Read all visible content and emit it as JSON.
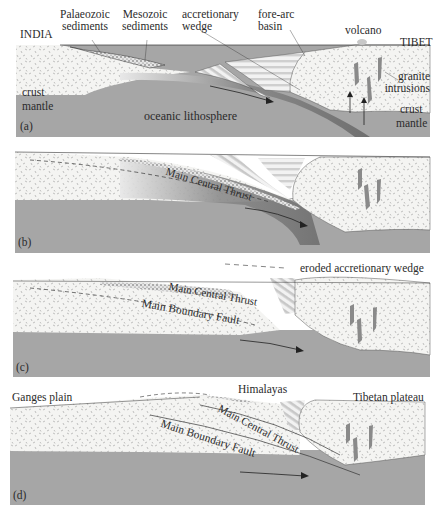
{
  "colors": {
    "crust_fill": "#f4f4f2",
    "crust_speckle": "#9a9a9a",
    "mantle": "#a6a6a6",
    "slab": "#7d7d7d",
    "sediments": "#d9d9d9",
    "granite": "#8a8a8a",
    "line": "#333333"
  },
  "panels": [
    {
      "id": "a",
      "label": "(a)",
      "texts": {
        "india": "INDIA",
        "tibet": "TIBET",
        "palaeozoic_1": "Palaeozoic",
        "palaeozoic_2": "sediments",
        "mesozoic_1": "Mesozoic",
        "mesozoic_2": "sediments",
        "accretionary_1": "accretionary",
        "accretionary_2": "wedge",
        "forearc_1": "fore-arc",
        "forearc_2": "basin",
        "volcano": "volcano",
        "granite_1": "granite",
        "granite_2": "intrusions",
        "crust_left": "crust",
        "mantle_left": "mantle",
        "crust_right": "crust",
        "mantle_right": "mantle",
        "oceanic": "oceanic lithosphere"
      }
    },
    {
      "id": "b",
      "label": "(b)",
      "texts": {
        "mct": "Main Central Thrust"
      }
    },
    {
      "id": "c",
      "label": "(c)",
      "texts": {
        "eroded": "eroded accretionary wedge",
        "mct": "Main Central Thrust",
        "mbf": "Main Boundary Fault"
      }
    },
    {
      "id": "d",
      "label": "(d)",
      "texts": {
        "ganges": "Ganges plain",
        "himalayas": "Himalayas",
        "tibetan": "Tibetan plateau",
        "mct": "Main Central Thrust",
        "mbf": "Main Boundary Fault"
      }
    }
  ]
}
